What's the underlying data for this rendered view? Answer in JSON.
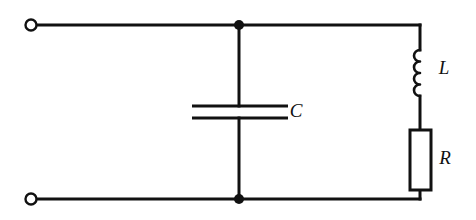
{
  "figure": {
    "type": "electrical-circuit-schematic",
    "background_color": "#ffffff",
    "line_color": "#111111",
    "width": 476,
    "height": 220
  },
  "components": [
    {
      "id": "capacitor",
      "symbol": "capacitor",
      "label": "C",
      "label_x": 296,
      "label_y": 113,
      "orientation": "vertical",
      "branch_x": 239,
      "plate_left": 192,
      "plate_right": 288,
      "plate_top_y": 106,
      "plate_bottom_y": 118
    },
    {
      "id": "inductor",
      "symbol": "inductor",
      "label": "L",
      "label_x": 444,
      "label_y": 70,
      "orientation": "vertical",
      "branch_x": 420,
      "coil_top_y": 50,
      "coil_bottom_y": 96,
      "loops": 4,
      "loop_radius": 6
    },
    {
      "id": "resistor",
      "symbol": "resistor",
      "label": "R",
      "label_x": 445,
      "label_y": 160,
      "orientation": "vertical",
      "branch_x": 420,
      "box_left": 410,
      "box_right": 431,
      "box_top": 130,
      "box_bottom": 190
    }
  ],
  "terminals": [
    {
      "id": "terminal-top-left",
      "x": 31,
      "y": 25,
      "radius": 5.5,
      "style": "open-circle"
    },
    {
      "id": "terminal-bottom-left",
      "x": 31,
      "y": 199,
      "radius": 5.5,
      "style": "open-circle"
    }
  ],
  "junctions": [
    {
      "id": "node-top",
      "x": 239,
      "y": 25,
      "radius": 5,
      "style": "filled-dot"
    },
    {
      "id": "node-bottom",
      "x": 239,
      "y": 199,
      "radius": 5,
      "style": "filled-dot"
    }
  ],
  "wires": {
    "top_rail": {
      "x1": 36,
      "y1": 25,
      "x2": 420,
      "y2": 25
    },
    "bottom_rail": {
      "x1": 36,
      "y1": 199,
      "x2": 420,
      "y2": 199
    },
    "cap_upper_lead": {
      "x1": 239,
      "y1": 25,
      "x2": 239,
      "y2": 106
    },
    "cap_lower_lead": {
      "x1": 239,
      "y1": 118,
      "x2": 239,
      "y2": 199
    },
    "right_upper_lead": {
      "x1": 420,
      "y1": 25,
      "x2": 420,
      "y2": 50
    },
    "right_mid_lead": {
      "x1": 420,
      "y1": 96,
      "x2": 420,
      "y2": 130
    },
    "right_lower_lead": {
      "x1": 420,
      "y1": 190,
      "x2": 420,
      "y2": 199
    }
  }
}
